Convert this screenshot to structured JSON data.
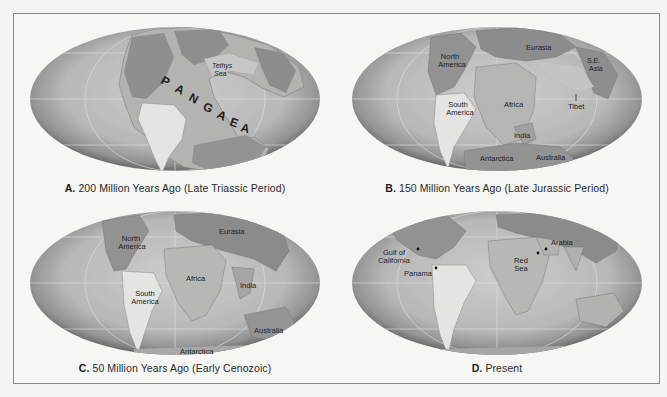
{
  "figure": {
    "panels": [
      {
        "id": "A",
        "letter": "A.",
        "caption": "200 Million Years Ago (Late Triassic Period)",
        "labels": {
          "pangaea": [
            "P",
            "A",
            "N",
            "G",
            "A",
            "E",
            "A"
          ],
          "tethys_line1": "Tethys",
          "tethys_line2": "Sea"
        }
      },
      {
        "id": "B",
        "letter": "B.",
        "caption": "150 Million Years Ago (Late Jurassic Period)",
        "labels": {
          "north_america_1": "North",
          "north_america_2": "America",
          "eurasia": "Eurasia",
          "se_asia_1": "S.E.",
          "se_asia_2": "Asia",
          "south_america_1": "South",
          "south_america_2": "America",
          "africa": "Africa",
          "tibet": "Tibet",
          "india": "India",
          "antarctica": "Antarctica",
          "australia": "Australia"
        }
      },
      {
        "id": "C",
        "letter": "C.",
        "caption": "50 Million Years Ago (Early Cenozoic)",
        "labels": {
          "north_america_1": "North",
          "north_america_2": "America",
          "eurasia": "Eurasia",
          "africa": "Africa",
          "india": "India",
          "south_america_1": "South",
          "south_america_2": "America",
          "australia": "Australia",
          "antarctica": "Antarctica"
        }
      },
      {
        "id": "D",
        "letter": "D.",
        "caption": "Present",
        "labels": {
          "gulf_1": "Gulf of",
          "gulf_2": "California",
          "panama": "Panama",
          "red_sea_1": "Red",
          "red_sea_2": "Sea",
          "arabia": "Arabia"
        }
      }
    ]
  },
  "colors": {
    "ocean_center": "#c9c9c9",
    "ocean_edge": "#6e6e6e",
    "land_light": "#e6e6e4",
    "land_mid": "#b5b5b3",
    "land_dark": "#8f8f8f",
    "grid": "#e2e2e2",
    "frame": "#8a8a8a"
  }
}
